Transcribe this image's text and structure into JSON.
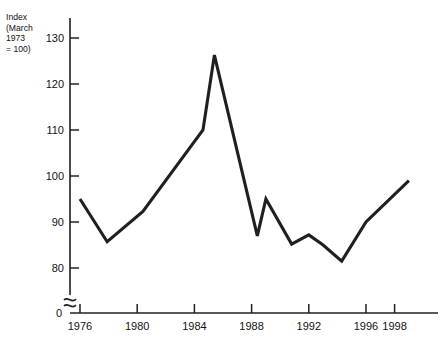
{
  "chart_data": {
    "type": "line",
    "title": "",
    "subtitle": "",
    "xlabel": "",
    "ylabel": "Index\n(March\n1973\n= 100)",
    "ylabel_lines": [
      "Index",
      "(March",
      "1973",
      "= 100)"
    ],
    "xlim": [
      1975.5,
      1999.5
    ],
    "ylim": [
      75,
      133
    ],
    "axis_break": true,
    "origin_label": "0",
    "grid": false,
    "legend": "none",
    "line_color": "#231f20",
    "line_width_px": 3.1,
    "yticks": [
      80,
      90,
      100,
      110,
      120,
      130
    ],
    "ytick_labels": [
      "80",
      "90",
      "100",
      "110",
      "120",
      "130"
    ],
    "xticks": [
      1976,
      1980,
      1984,
      1988,
      1992,
      1996,
      1998
    ],
    "xtick_labels": [
      "1976",
      "1980",
      "1984",
      "1988",
      "1992",
      "1996",
      "1998"
    ],
    "x": [
      1976,
      1977.9,
      1980.4,
      1984.6,
      1985.4,
      1988.4,
      1989.0,
      1990.8,
      1992.0,
      1993.0,
      1994.3,
      1996.0,
      1999.0
    ],
    "values": [
      95.0,
      85.7,
      92.3,
      110.0,
      126.3,
      87.0,
      95.0,
      85.2,
      87.2,
      85.0,
      81.5,
      90.0,
      99.0
    ],
    "series": [
      {
        "name": "Sterling exchange rate index",
        "x": [
          1976,
          1977.9,
          1980.4,
          1984.6,
          1985.4,
          1988.4,
          1989.0,
          1990.8,
          1992.0,
          1993.0,
          1994.3,
          1996.0,
          1999.0
        ],
        "values": [
          95.0,
          85.7,
          92.3,
          110.0,
          126.3,
          87.0,
          95.0,
          85.2,
          87.2,
          85.0,
          81.5,
          90.0,
          99.0
        ]
      }
    ],
    "annotations": []
  }
}
